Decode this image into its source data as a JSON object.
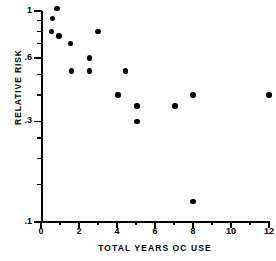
{
  "chart_data": {
    "type": "scatter",
    "title": "",
    "xlabel": "TOTAL YEARS OC USE",
    "ylabel": "RELATIVE RISK",
    "xlim": [
      0,
      12
    ],
    "ylim": [
      0.1,
      1.05
    ],
    "yscale": "log",
    "xscale": "linear",
    "grid": false,
    "legend": null,
    "x_ticks": [
      0,
      2,
      4,
      6,
      8,
      10,
      12
    ],
    "x_tick_labels": [
      "0",
      "2",
      "4",
      "6",
      "8",
      "10",
      "12"
    ],
    "x_minor_ticks": [
      1,
      3,
      5,
      7,
      9,
      11
    ],
    "y_ticks": [
      1.0,
      0.6,
      0.3,
      0.1
    ],
    "y_tick_labels": [
      "1",
      ".6",
      ".3",
      ".1"
    ],
    "y_minor_ticks": [
      0.9,
      0.8,
      0.7,
      0.5,
      0.4,
      0.25,
      0.2,
      0.15
    ],
    "points": [
      {
        "x": 0.85,
        "y": 1.03
      },
      {
        "x": 0.6,
        "y": 0.92
      },
      {
        "x": 0.55,
        "y": 0.8
      },
      {
        "x": 0.95,
        "y": 0.76
      },
      {
        "x": 1.55,
        "y": 0.7
      },
      {
        "x": 3.0,
        "y": 0.8
      },
      {
        "x": 2.55,
        "y": 0.6
      },
      {
        "x": 1.6,
        "y": 0.52
      },
      {
        "x": 2.55,
        "y": 0.52
      },
      {
        "x": 4.45,
        "y": 0.52
      },
      {
        "x": 4.05,
        "y": 0.4
      },
      {
        "x": 5.05,
        "y": 0.355
      },
      {
        "x": 5.05,
        "y": 0.3
      },
      {
        "x": 7.05,
        "y": 0.355
      },
      {
        "x": 8.0,
        "y": 0.4
      },
      {
        "x": 12.0,
        "y": 0.4
      },
      {
        "x": 8.0,
        "y": 0.125
      }
    ]
  },
  "colors": {
    "marker": "#000000",
    "axis": "#000000",
    "background": "#ffffff"
  }
}
